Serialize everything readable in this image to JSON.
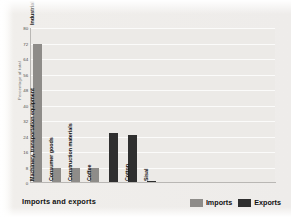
{
  "caption": "Imports and exports",
  "legend": {
    "position": "bottom-right",
    "items": [
      {
        "label": "Imports",
        "color": "#8e8c89"
      },
      {
        "label": "Exports",
        "color": "#2f2f2f"
      }
    ]
  },
  "chart_data": {
    "type": "bar",
    "title": "Imports and exports",
    "subtitle": "",
    "xlabel": "",
    "ylabel": "Percentage of total",
    "ylim": [
      0,
      80
    ],
    "ytick_step": 8,
    "yticks": [
      80,
      72,
      64,
      56,
      48,
      40,
      32,
      24,
      16,
      8,
      0
    ],
    "grid": true,
    "grid_axis": "y",
    "categories": [
      "Machinery, transportation equipment/Industrial goods",
      "Consumer goods",
      "Construction materials",
      "Coffee",
      "Cotton",
      "Sisal"
    ],
    "series": [
      {
        "name": "Imports",
        "color": "#8e8c89",
        "values": [
          72,
          8,
          8,
          8,
          null,
          null
        ]
      },
      {
        "name": "Exports",
        "color": "#2f2f2f",
        "values": [
          null,
          null,
          null,
          26,
          25,
          1
        ]
      }
    ],
    "bars": [
      {
        "label": "Machinery, transportation equipment/Industrial goods",
        "value": 72,
        "series": "Imports"
      },
      {
        "label": "Consumer goods",
        "value": 8,
        "series": "Imports"
      },
      {
        "label": "Construction materials",
        "value": 8,
        "series": "Imports"
      },
      {
        "label": "Coffee",
        "value": 8,
        "series": "Imports"
      },
      {
        "label": "Coffee",
        "value": 26,
        "series": "Exports"
      },
      {
        "label": "Cotton",
        "value": 25,
        "series": "Exports"
      },
      {
        "label": "Sisal",
        "value": 1,
        "series": "Exports"
      }
    ],
    "bar_labels_rotated": true,
    "legend_position": "bottom-right"
  },
  "colors": {
    "background": "#f1efec",
    "plot_background": "#eceae7",
    "gridline": "#fbfbfa",
    "axis": "#b9b7b4",
    "imports": "#8e8c89",
    "exports": "#2f2f2f",
    "text": "#111111",
    "tick_text": "#4a4a4a"
  }
}
